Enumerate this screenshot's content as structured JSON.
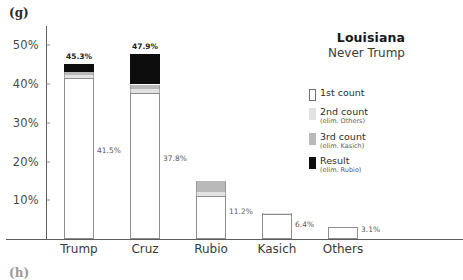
{
  "panel": {
    "letter_top": "(g)",
    "letter_bottom": "(h)"
  },
  "titleblock": {
    "title": "Louisiana",
    "subtitle": "Never Trump"
  },
  "legend": {
    "items": [
      {
        "key": "first",
        "swatch": "legend-swatch-1st-count",
        "label": "1st count",
        "note": ""
      },
      {
        "key": "second",
        "swatch": "legend-swatch-2nd-count",
        "label": "2nd count",
        "note": "(elim. Others)"
      },
      {
        "key": "third",
        "swatch": "legend-swatch-3rd-count",
        "label": "3rd count",
        "note": "(elim. Kasich)"
      },
      {
        "key": "result",
        "swatch": "legend-swatch-result",
        "label": "Result",
        "note": "(elim. Rubio)"
      }
    ]
  },
  "chart_data": {
    "type": "bar",
    "title": "Louisiana",
    "subtitle": "Never Trump",
    "xlabel": "",
    "ylabel": "",
    "ylim": [
      0,
      55
    ],
    "grid": false,
    "legend_position": "right",
    "stacked": true,
    "yticks": [
      "10%",
      "20%",
      "30%",
      "40%",
      "50%"
    ],
    "ytick_values": [
      10,
      20,
      30,
      40,
      50
    ],
    "categories": [
      "Trump",
      "Cruz",
      "Rubio",
      "Kasich",
      "Others"
    ],
    "series": [
      {
        "name": "1st count",
        "values": [
          41.5,
          37.8,
          11.2,
          6.4,
          3.1
        ]
      },
      {
        "name": "2nd count (elim. Others)",
        "values": [
          42.4,
          38.8,
          12.1,
          6.7,
          0
        ]
      },
      {
        "name": "3rd count (elim. Kasich)",
        "values": [
          43.1,
          39.9,
          15.0,
          0,
          0
        ]
      },
      {
        "name": "Result (elim. Rubio)",
        "values": [
          45.3,
          47.9,
          0,
          0,
          0
        ]
      }
    ],
    "bars": [
      {
        "category": "Trump",
        "top_label": "45.3%",
        "side_label": "41.5%",
        "first": 41.5,
        "second": 42.4,
        "third": 43.1,
        "result": 45.3
      },
      {
        "category": "Cruz",
        "top_label": "47.9%",
        "side_label": "37.8%",
        "first": 37.8,
        "second": 38.8,
        "third": 39.9,
        "result": 47.9
      },
      {
        "category": "Rubio",
        "top_label": "",
        "side_label": "11.2%",
        "first": 11.2,
        "second": 12.1,
        "third": 15.0,
        "result": null
      },
      {
        "category": "Kasich",
        "top_label": "",
        "side_label": "6.4%",
        "first": 6.4,
        "second": 6.7,
        "third": null,
        "result": null
      },
      {
        "category": "Others",
        "top_label": "",
        "side_label": "3.1%",
        "first": 3.1,
        "second": null,
        "third": null,
        "result": null
      }
    ]
  }
}
